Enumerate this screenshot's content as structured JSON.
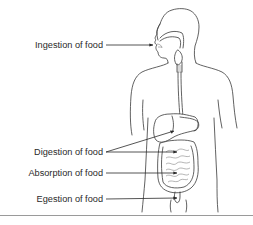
{
  "diagram": {
    "labels": [
      {
        "id": "ingestion",
        "text": "Ingestion of food"
      },
      {
        "id": "digestion",
        "text": "Digestion of food"
      },
      {
        "id": "absorption",
        "text": "Absorption of food"
      },
      {
        "id": "egestion",
        "text": "Egestion of food"
      }
    ]
  },
  "colors": {
    "line": "#3a3a3a",
    "text": "#2a2a2a",
    "background": "#ffffff",
    "separator": "#9a9a9a"
  }
}
